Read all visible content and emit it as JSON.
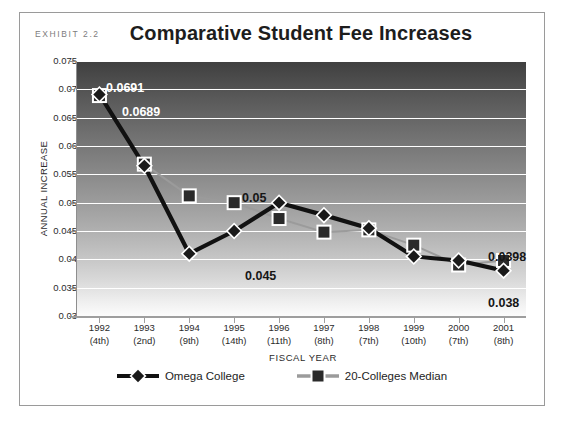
{
  "exhibit": {
    "label": "EXHIBIT 2.2"
  },
  "chart_data": {
    "type": "line",
    "title": "Comparative Student Fee Increases",
    "xlabel": "FISCAL YEAR",
    "ylabel": "ANNUAL INCREASE",
    "grid": true,
    "legend_position": "bottom",
    "ylim": [
      0.03,
      0.075
    ],
    "ytick_labels": [
      "0.075",
      "0.07",
      "0.065",
      "0.06",
      "0.055",
      "0.05",
      "0.045",
      "0.04",
      "0.035",
      "0.03"
    ],
    "ytick_values": [
      0.075,
      0.07,
      0.065,
      0.06,
      0.055,
      0.05,
      0.045,
      0.04,
      0.035,
      0.03
    ],
    "categories": [
      "1992",
      "1993",
      "1994",
      "1995",
      "1996",
      "1997",
      "1998",
      "1999",
      "2000",
      "2001"
    ],
    "category_sublabels": [
      "(4th)",
      "(2nd)",
      "(9th)",
      "(14th)",
      "(11th)",
      "(8th)",
      "(7th)",
      "(10th)",
      "(7th)",
      "(8th)"
    ],
    "series": [
      {
        "name": "Omega College",
        "color": "#111111",
        "marker": "diamond",
        "values": [
          0.0691,
          0.0565,
          0.041,
          0.045,
          0.05,
          0.0478,
          0.0455,
          0.0405,
          0.0398,
          0.038
        ]
      },
      {
        "name": "20-Colleges Median",
        "color": "#9b9b9b",
        "marker": "square",
        "values": [
          0.0689,
          0.0568,
          0.0512,
          0.05,
          0.0472,
          0.0448,
          0.0452,
          0.0425,
          0.039,
          0.0398
        ]
      }
    ],
    "annotations": [
      {
        "text": "0.0691",
        "style": "light",
        "left": 86,
        "top": 68
      },
      {
        "text": "0.0689",
        "style": "light",
        "left": 102,
        "top": 92
      },
      {
        "text": "0.05",
        "style": "dark",
        "left": 222,
        "top": 178
      },
      {
        "text": "0.045",
        "style": "dark",
        "left": 225,
        "top": 256
      },
      {
        "text": "0.0398",
        "style": "dark",
        "left": 468,
        "top": 237
      },
      {
        "text": "0.038",
        "style": "dark",
        "left": 468,
        "top": 283
      }
    ]
  }
}
